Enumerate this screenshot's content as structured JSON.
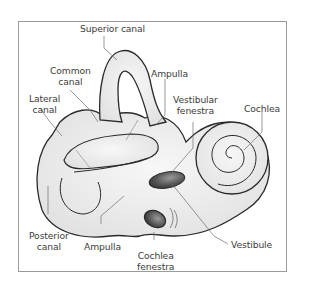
{
  "diagram": {
    "labels": {
      "superior_canal": "Superior canal",
      "common_canal_1": "Common",
      "common_canal_2": "canal",
      "lateral_canal_1": "Lateral",
      "lateral_canal_2": "canal",
      "ampulla_top": "Ampulla",
      "vestibular_fenestra_1": "Vestibular",
      "vestibular_fenestra_2": "fenestra",
      "cochlea": "Cochlea",
      "posterior_canal_1": "Posterior",
      "posterior_canal_2": "canal",
      "ampulla_bottom": "Ampulla",
      "cochlea_fenestra_1": "Cochlea",
      "cochlea_fenestra_2": "fenestra",
      "vestibule": "Vestibule"
    },
    "colors": {
      "body_fill": "#e9e9e9",
      "outline": "#2a2a2a",
      "leader_line": "#6e6e6e",
      "window_dark": "#4a4a4a",
      "frame_border": "#9a9a9a",
      "text": "#3c3c3c"
    }
  }
}
